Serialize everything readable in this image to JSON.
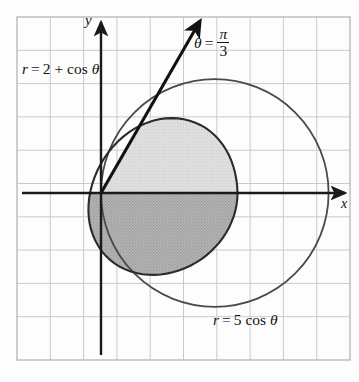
{
  "figure": {
    "kind": "polar-coordinates-diagram",
    "background": "#fdfdfd",
    "frame": {
      "x": 17,
      "y": 17,
      "width": 333,
      "height": 343,
      "border_color": "#b9b9b9",
      "grid_color": "#c9c9c9",
      "grid_spacing_px": 33.3
    },
    "axes": {
      "origin_px": {
        "x": 101,
        "y": 193
      },
      "unit_px": 45.5,
      "color": "#1a1a1a",
      "x_label": "x",
      "y_label": "y"
    },
    "labels": {
      "limacon": {
        "prefix": "r",
        "equals": "=",
        "expr": "2 + cos",
        "theta": "θ",
        "full": "r = 2 + cos θ",
        "x": 22,
        "y": 62
      },
      "circle": {
        "prefix": "r",
        "equals": "=",
        "expr": "5 cos",
        "theta": "θ",
        "full": "r = 5 cos θ",
        "x": 215,
        "y": 313
      },
      "ray": {
        "theta": "θ",
        "equals": "=",
        "numerator": "π",
        "denominator": "3",
        "full": "θ = π/3",
        "x": 196,
        "y": 25
      }
    },
    "curves": [
      {
        "name": "limacon",
        "equation": "r = 2 + cos θ",
        "stroke": "#2b2b2b",
        "stroke_width": 2.0,
        "x_intercept_right": 3,
        "x_intercept_left": -1,
        "y_extent_px": {
          "top": 78,
          "bottom": 308
        }
      },
      {
        "name": "circle",
        "equation": "r = 5 cos θ",
        "stroke": "#4a4a4a",
        "stroke_width": 1.7,
        "center_units": {
          "x": 2.5,
          "y": 0
        },
        "radius_units": 2.5,
        "x_intercept_right": 5
      }
    ],
    "ray_line": {
      "angle_label": "θ = π/3",
      "angle_degrees": 60,
      "from_px": {
        "x": 101,
        "y": 193
      },
      "to_px": {
        "x": 200,
        "y": 20
      },
      "stroke": "#111111",
      "stroke_width": 3.0,
      "arrowhead": true
    },
    "intersections": [
      {
        "px": {
          "x": 157,
          "y": 96
        },
        "note": "upper curve intersection at θ = π/3"
      },
      {
        "px": {
          "x": 157,
          "y": 291
        },
        "note": "lower curve intersection at θ = -π/3"
      }
    ],
    "shaded_regions": [
      {
        "name": "upper-light-region",
        "fill": "#d6d6d6",
        "opacity": 0.85,
        "description": "region between ray and x-axis bounded by limacon"
      },
      {
        "name": "lower-dark-region",
        "fill": "#a8a8a8",
        "opacity": 0.9,
        "description": "region below x-axis inside limacon, hatched/denser shading"
      }
    ]
  }
}
